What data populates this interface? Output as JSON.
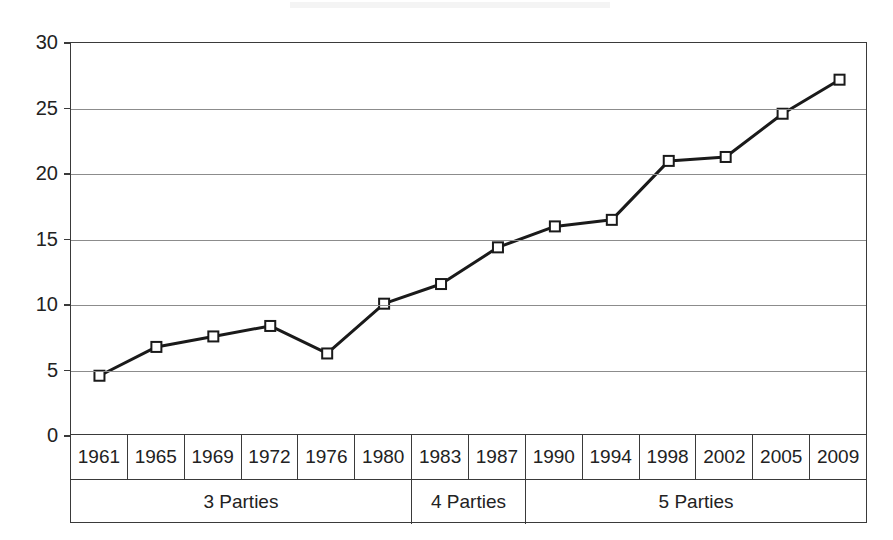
{
  "chart_data": {
    "type": "line",
    "title": "",
    "subtitle": "",
    "xlabel": "",
    "ylabel": "",
    "categories": [
      "1961",
      "1965",
      "1969",
      "1972",
      "1976",
      "1980",
      "1983",
      "1987",
      "1990",
      "1994",
      "1998",
      "2002",
      "2005",
      "2009"
    ],
    "values": [
      4.6,
      6.8,
      7.6,
      8.4,
      6.3,
      10.1,
      11.6,
      14.4,
      16.0,
      16.5,
      21.0,
      21.3,
      24.6,
      27.2
    ],
    "series": [
      {
        "name": "",
        "values": [
          4.6,
          6.8,
          7.6,
          8.4,
          6.3,
          10.1,
          11.6,
          14.4,
          16.0,
          16.5,
          21.0,
          21.3,
          24.6,
          27.2
        ]
      }
    ],
    "yticks": [
      0,
      5,
      10,
      15,
      20,
      25,
      30
    ],
    "ytick_labels": [
      "0",
      "5",
      "10",
      "15",
      "20",
      "25",
      "30"
    ],
    "ylim": [
      0,
      30
    ],
    "xlim": [
      0,
      14
    ],
    "grid": "horizontal",
    "legend": "none",
    "marker": "open-square",
    "line_color": "#1a1a1a",
    "marker_fill": "#ffffff",
    "marker_stroke": "#1a1a1a",
    "grid_color": "#8c8c8c",
    "axis_color": "#3a3a3a",
    "groups": [
      {
        "label": "3 Parties",
        "span": 6,
        "members": [
          "1961",
          "1965",
          "1969",
          "1972",
          "1976",
          "1980"
        ]
      },
      {
        "label": "4 Parties",
        "span": 2,
        "members": [
          "1983",
          "1987"
        ]
      },
      {
        "label": "5 Parties",
        "span": 6,
        "members": [
          "1990",
          "1994",
          "1998",
          "2002",
          "2005",
          "2009"
        ]
      }
    ]
  }
}
